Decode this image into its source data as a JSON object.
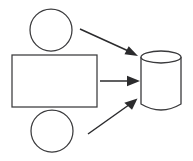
{
  "diagram": {
    "type": "flow-diagram",
    "canvas": {
      "width": 193,
      "height": 161,
      "background": "#ffffff"
    },
    "stroke_color": "#3a3a3c",
    "arrow_color": "#2b2b2d",
    "nodes": [
      {
        "id": "source-circle-top",
        "name": "top-circle-node",
        "shape": "circle",
        "label": "",
        "cx": 51,
        "cy": 30,
        "r": 21
      },
      {
        "id": "process-rectangle",
        "name": "rectangle-node",
        "shape": "rectangle",
        "label": "",
        "x": 12,
        "y": 55,
        "width": 85,
        "height": 52
      },
      {
        "id": "source-circle-bottom",
        "name": "bottom-circle-node",
        "shape": "circle",
        "label": "",
        "cx": 52,
        "cy": 131,
        "r": 21
      },
      {
        "id": "target-cylinder",
        "name": "cylinder-node",
        "shape": "cylinder",
        "label": "",
        "x": 141,
        "y": 51,
        "width": 40,
        "height": 59,
        "ellipse_ry": 6
      }
    ],
    "connectors": [
      {
        "id": "arrow-top",
        "name": "arrow-top-circle-to-cylinder",
        "from": "source-circle-top",
        "to": "target-cylinder",
        "label": "",
        "x1": 80,
        "y1": 29,
        "x2": 137,
        "y2": 56,
        "arrowhead": "filled-triangle"
      },
      {
        "id": "arrow-middle",
        "name": "arrow-rectangle-to-cylinder",
        "from": "process-rectangle",
        "to": "target-cylinder",
        "label": "",
        "x1": 100,
        "y1": 81,
        "x2": 139,
        "y2": 81,
        "arrowhead": "filled-triangle"
      },
      {
        "id": "arrow-bottom",
        "name": "arrow-bottom-circle-to-cylinder",
        "from": "source-circle-bottom",
        "to": "target-cylinder",
        "label": "",
        "x1": 88,
        "y1": 134,
        "x2": 137,
        "y2": 99,
        "arrowhead": "filled-triangle"
      }
    ]
  }
}
